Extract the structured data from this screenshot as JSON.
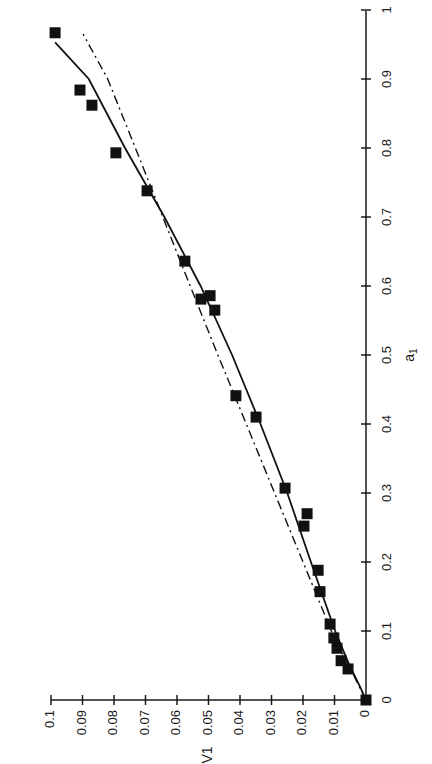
{
  "chart_data": {
    "type": "scatter",
    "title": "",
    "orientation": "rotated-90-ccw",
    "xlabel": "a_1",
    "ylabel": "V1",
    "xlim": [
      0,
      1
    ],
    "ylim": [
      0,
      0.1
    ],
    "x_ticks": [
      0,
      0.1,
      0.2,
      0.3,
      0.4,
      0.5,
      0.6,
      0.7,
      0.8,
      0.9,
      1
    ],
    "x_tick_labels": [
      "0",
      "0.1",
      "0.2",
      "0.3",
      "0.4",
      "0.5",
      "0.6",
      "0.7",
      "0.8",
      "0.9",
      "1"
    ],
    "y_ticks": [
      0,
      0.01,
      0.02,
      0.03,
      0.04,
      0.05,
      0.06,
      0.07,
      0.08,
      0.09,
      0.1
    ],
    "y_tick_labels": [
      "0",
      "0.01",
      "0.02",
      "0.03",
      "0.04",
      "0.05",
      "0.06",
      "0.07",
      "0.08",
      "0.09",
      "0.1"
    ],
    "grid": false,
    "legend": null,
    "series": [
      {
        "name": "data",
        "style": "filled-square-markers",
        "color": "#111111",
        "points": [
          {
            "x": 0.0,
            "y": 0.0
          },
          {
            "x": 0.045,
            "y": 0.0057
          },
          {
            "x": 0.057,
            "y": 0.0079
          },
          {
            "x": 0.075,
            "y": 0.0092
          },
          {
            "x": 0.09,
            "y": 0.0102
          },
          {
            "x": 0.11,
            "y": 0.0114
          },
          {
            "x": 0.157,
            "y": 0.0146
          },
          {
            "x": 0.188,
            "y": 0.0152
          },
          {
            "x": 0.252,
            "y": 0.0197
          },
          {
            "x": 0.27,
            "y": 0.0187
          },
          {
            "x": 0.307,
            "y": 0.0257
          },
          {
            "x": 0.41,
            "y": 0.0349
          },
          {
            "x": 0.441,
            "y": 0.0413
          },
          {
            "x": 0.565,
            "y": 0.048
          },
          {
            "x": 0.581,
            "y": 0.0524
          },
          {
            "x": 0.586,
            "y": 0.0495
          },
          {
            "x": 0.636,
            "y": 0.0575
          },
          {
            "x": 0.738,
            "y": 0.0695
          },
          {
            "x": 0.793,
            "y": 0.0794
          },
          {
            "x": 0.862,
            "y": 0.087
          },
          {
            "x": 0.884,
            "y": 0.0908
          },
          {
            "x": 0.967,
            "y": 0.0987
          }
        ]
      },
      {
        "name": "fit-solid",
        "style": "solid-line",
        "color": "#111111",
        "points": [
          {
            "x": 0.0,
            "y": 0.0
          },
          {
            "x": 0.02,
            "y": 0.002
          },
          {
            "x": 0.05,
            "y": 0.0052
          },
          {
            "x": 0.1,
            "y": 0.0098
          },
          {
            "x": 0.2,
            "y": 0.0175
          },
          {
            "x": 0.3,
            "y": 0.025
          },
          {
            "x": 0.4,
            "y": 0.0335
          },
          {
            "x": 0.5,
            "y": 0.0425
          },
          {
            "x": 0.6,
            "y": 0.0525
          },
          {
            "x": 0.7,
            "y": 0.064
          },
          {
            "x": 0.8,
            "y": 0.0765
          },
          {
            "x": 0.9,
            "y": 0.088
          },
          {
            "x": 0.953,
            "y": 0.0987
          }
        ]
      },
      {
        "name": "fit-dashdot",
        "style": "dash-dot-line",
        "color": "#111111",
        "points": [
          {
            "x": 0.0,
            "y": 0.0
          },
          {
            "x": 0.1,
            "y": 0.011
          },
          {
            "x": 0.2,
            "y": 0.02
          },
          {
            "x": 0.3,
            "y": 0.029
          },
          {
            "x": 0.4,
            "y": 0.038
          },
          {
            "x": 0.5,
            "y": 0.047
          },
          {
            "x": 0.6,
            "y": 0.0558
          },
          {
            "x": 0.7,
            "y": 0.0645
          },
          {
            "x": 0.8,
            "y": 0.0732
          },
          {
            "x": 0.9,
            "y": 0.082
          },
          {
            "x": 0.965,
            "y": 0.0898
          }
        ]
      }
    ]
  },
  "layout": {
    "origin_px": [
      366,
      700
    ],
    "a1_px_per_unit": 690,
    "v1_px_per_unit": 3150,
    "marker_size": 11
  }
}
